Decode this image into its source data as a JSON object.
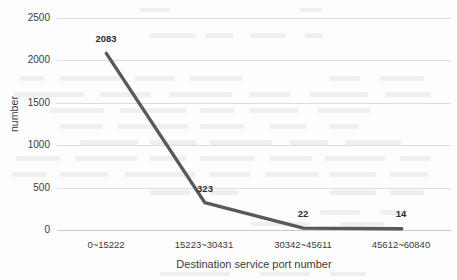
{
  "chart_data": {
    "type": "line",
    "title": "",
    "xlabel": "Destination service port number",
    "ylabel": "number",
    "categories": [
      "0~15222",
      "15223~30431",
      "30342~45611",
      "45612~60840"
    ],
    "values": [
      2083,
      323,
      22,
      14
    ],
    "point_labels": [
      "2083",
      "323",
      "22",
      "14"
    ],
    "series": [
      {
        "name": "number",
        "values": [
          2083,
          323,
          22,
          14
        ]
      }
    ],
    "ylim": [
      0,
      2500
    ],
    "yticks": [
      0,
      500,
      1000,
      1500,
      2000,
      2500
    ],
    "ytick_labels": [
      "0",
      "500",
      "1000",
      "1500",
      "2000",
      "2500"
    ],
    "grid": true,
    "grid_axis": "y",
    "legend": false,
    "legend_position": "none",
    "line_color": "#595959",
    "line_width": 3.4,
    "markers": false,
    "background_color": "#fdfdfd",
    "gridline_color": "#dcdcdc",
    "text_color": "#3b3b3b"
  }
}
